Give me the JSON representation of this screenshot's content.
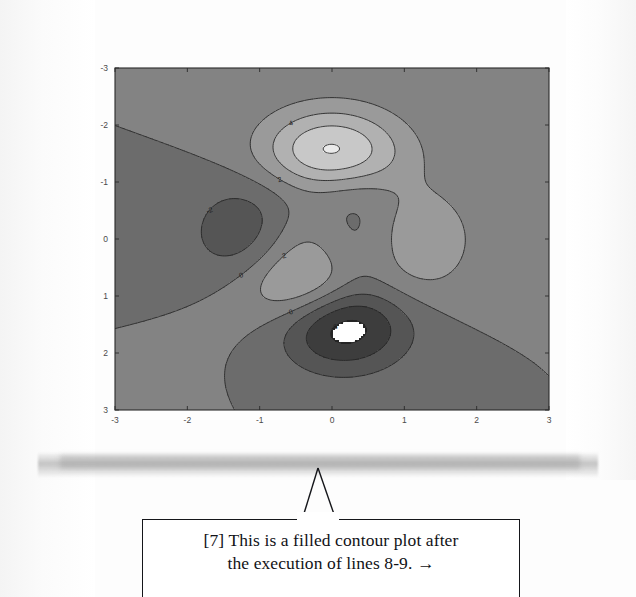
{
  "page": {
    "kind": "scanned-book-page",
    "background_color": "#fdfdfd"
  },
  "figure": {
    "name": "filled-contour-plot",
    "caption_marker": "[7]"
  },
  "callout": {
    "marker": "[7]",
    "line1": "[7] This is a filled contour plot after",
    "line2": "the execution of lines 8-9.  →",
    "full_text": "[7] This is a filled contour plot after the execution of lines 8-9. →",
    "border_color": "#15161a",
    "text_color": "#111216"
  },
  "chart_data": {
    "type": "heatmap",
    "subtype": "filled-contour",
    "title": "",
    "xlabel": "",
    "ylabel": "",
    "xlim": [
      -3,
      3
    ],
    "ylim": [
      -3,
      3
    ],
    "xticks": [
      -3,
      -2,
      -1,
      0,
      1,
      2,
      3
    ],
    "yticks": [
      -3,
      -2,
      -1,
      0,
      1,
      2,
      3
    ],
    "xticklabels": [
      "-3",
      "-2",
      "-1",
      "0",
      "1",
      "2",
      "3"
    ],
    "yticklabels": [
      "-3",
      "-2",
      "-1",
      "0",
      "1",
      "2",
      "3"
    ],
    "grid": false,
    "legend": "none",
    "colormap": "gray",
    "colormap_note": "low values dark, high values light; deepest minimum wraps to white",
    "function": "peaks",
    "formula": "z = 3*(1-x)^2*exp(-x^2-(y+1)^2) - 10*(x/5 - x^3 - y^5)*exp(-x^2-y^2) - (1/3)*exp(-(x+1)^2 - y^2)",
    "contour_levels": [
      -8,
      -6,
      -4,
      -2,
      0,
      2,
      4,
      6,
      8
    ],
    "labeled_contours": [
      "0",
      "2",
      "4",
      "6",
      "8",
      "-2",
      "-4",
      "-6",
      "-8"
    ],
    "zrange": [
      -6.55,
      8.08
    ],
    "features": [
      {
        "name": "global-maximum",
        "x": -0.01,
        "y": 1.58,
        "z": 8.08,
        "shade": "lightest"
      },
      {
        "name": "global-minimum",
        "x": 0.23,
        "y": -1.63,
        "z": -6.55,
        "shade": "darkest-white-core"
      },
      {
        "name": "secondary-minimum",
        "x": -1.35,
        "y": 0.2,
        "z": -3.05,
        "shade": "dark"
      },
      {
        "name": "secondary-maximum",
        "x": -0.46,
        "y": -0.63,
        "z": 3.78,
        "shade": "light"
      },
      {
        "name": "minor-maximum",
        "x": 1.28,
        "y": -0.2,
        "z": 2.2,
        "shade": "light-gray"
      }
    ],
    "axis_face_color": "#7e7e7e",
    "contour_line_color": "#232323"
  }
}
